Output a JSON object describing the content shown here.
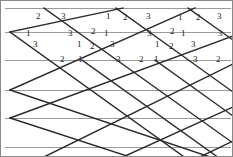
{
  "figure": {
    "canvas": {
      "width": 233,
      "height": 157
    },
    "colors": {
      "background": "#ffffff",
      "lattice_stroke": "#2b2b2b",
      "guide_line": "#9a9a9a",
      "label_text": "#1a1a1a",
      "border": "#8a8a8a"
    },
    "stroke_widths": {
      "lattice": 1.4,
      "guide": 1.0,
      "border": 1.0
    },
    "guide_lines": {
      "name": "horizontal-guide-lines",
      "count": 6,
      "orientation": "horizontal",
      "y_values": [
        8,
        32,
        60,
        90,
        118,
        147
      ],
      "x_start": 5,
      "x_end": 231
    },
    "lattice": {
      "name": "rhombus-lattice",
      "rhombus_width": 72,
      "rhombus_height": 52,
      "down_right_lines": [
        {
          "x1": 10,
          "y1": 32,
          "x2": 233,
          "y2": 192
        },
        {
          "x1": 44,
          "y1": 8,
          "x2": 233,
          "y2": 143
        },
        {
          "x1": 82,
          "y1": 60,
          "x2": 233,
          "y2": 168
        },
        {
          "x1": 116,
          "y1": 8,
          "x2": 233,
          "y2": 92
        },
        {
          "x1": 155,
          "y1": 60,
          "x2": 233,
          "y2": 116
        },
        {
          "x1": 188,
          "y1": 8,
          "x2": 233,
          "y2": 40
        },
        {
          "x1": 10,
          "y1": 90,
          "x2": 210,
          "y2": 157
        },
        {
          "x1": 10,
          "y1": 118,
          "x2": 130,
          "y2": 157
        }
      ],
      "up_right_lines": [
        {
          "x1": 10,
          "y1": 32,
          "x2": 123,
          "y2": 8
        },
        {
          "x1": 10,
          "y1": 90,
          "x2": 195,
          "y2": 8
        },
        {
          "x1": 10,
          "y1": 118,
          "x2": 233,
          "y2": 36
        },
        {
          "x1": 44,
          "y1": 157,
          "x2": 233,
          "y2": 64
        },
        {
          "x1": 123,
          "y1": 157,
          "x2": 233,
          "y2": 107
        },
        {
          "x1": 200,
          "y1": 157,
          "x2": 233,
          "y2": 141
        }
      ]
    },
    "labels": [
      {
        "id": "l01",
        "text": "2",
        "x": 36,
        "y": 12
      },
      {
        "id": "l02",
        "text": "3",
        "x": 61,
        "y": 12
      },
      {
        "id": "l03",
        "text": "1",
        "x": 106,
        "y": 12
      },
      {
        "id": "l04",
        "text": "2",
        "x": 123,
        "y": 13
      },
      {
        "id": "l05",
        "text": "3",
        "x": 146,
        "y": 12
      },
      {
        "id": "l06",
        "text": "1",
        "x": 178,
        "y": 13
      },
      {
        "id": "l07",
        "text": "2",
        "x": 196,
        "y": 13
      },
      {
        "id": "l08",
        "text": "3",
        "x": 217,
        "y": 12
      },
      {
        "id": "l09",
        "text": "1",
        "x": 26,
        "y": 29
      },
      {
        "id": "l10",
        "text": "3",
        "x": 68,
        "y": 29
      },
      {
        "id": "l11",
        "text": "2",
        "x": 91,
        "y": 27
      },
      {
        "id": "l12",
        "text": "1",
        "x": 104,
        "y": 29
      },
      {
        "id": "l13",
        "text": "3",
        "x": 147,
        "y": 29
      },
      {
        "id": "l14",
        "text": "2",
        "x": 170,
        "y": 27
      },
      {
        "id": "l15",
        "text": "1",
        "x": 181,
        "y": 29
      },
      {
        "id": "l16",
        "text": "3",
        "x": 218,
        "y": 29
      },
      {
        "id": "l17",
        "text": "3",
        "x": 33,
        "y": 40
      },
      {
        "id": "l18",
        "text": "1",
        "x": 77,
        "y": 40
      },
      {
        "id": "l19",
        "text": "2",
        "x": 90,
        "y": 42
      },
      {
        "id": "l20",
        "text": "3",
        "x": 110,
        "y": 40
      },
      {
        "id": "l21",
        "text": "1",
        "x": 155,
        "y": 40
      },
      {
        "id": "l22",
        "text": "2",
        "x": 169,
        "y": 42
      },
      {
        "id": "l23",
        "text": "3",
        "x": 191,
        "y": 40
      },
      {
        "id": "l24",
        "text": "2",
        "x": 60,
        "y": 55
      },
      {
        "id": "l25",
        "text": "1",
        "x": 78,
        "y": 55
      },
      {
        "id": "l26",
        "text": "3",
        "x": 116,
        "y": 55
      },
      {
        "id": "l27",
        "text": "2",
        "x": 139,
        "y": 55
      },
      {
        "id": "l28",
        "text": "1",
        "x": 154,
        "y": 55
      },
      {
        "id": "l29",
        "text": "3",
        "x": 193,
        "y": 55
      },
      {
        "id": "l30",
        "text": "2",
        "x": 216,
        "y": 55
      }
    ],
    "label_legend": {
      "name": "angle-index-legend",
      "values": [
        "1",
        "2",
        "3"
      ],
      "meaning": "angle index at lattice vertex"
    }
  }
}
